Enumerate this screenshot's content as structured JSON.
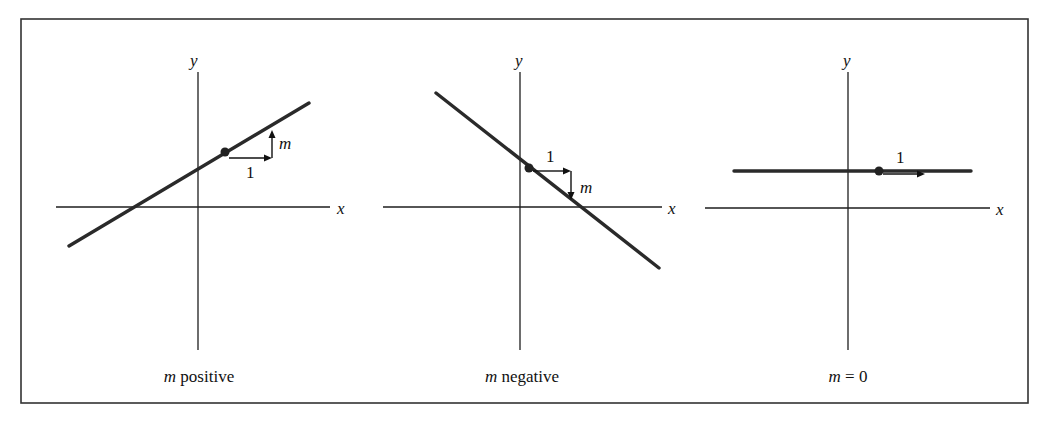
{
  "figure": {
    "panels": [
      {
        "id": "positive",
        "caption_var": "m",
        "caption_rest": " positive",
        "axis_x_label": "x",
        "axis_y_label": "y",
        "run_label": "1",
        "rise_label": "m"
      },
      {
        "id": "negative",
        "caption_var": "m",
        "caption_rest": " negative",
        "axis_x_label": "x",
        "axis_y_label": "y",
        "run_label": "1",
        "rise_label": "m"
      },
      {
        "id": "zero",
        "caption_var": "m",
        "caption_rest": " = 0",
        "axis_x_label": "x",
        "axis_y_label": "y",
        "run_label": "1"
      }
    ]
  }
}
